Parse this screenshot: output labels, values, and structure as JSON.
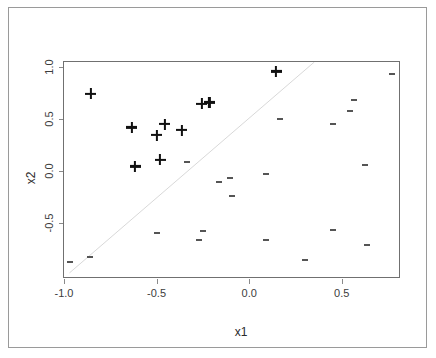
{
  "figure": {
    "title": "",
    "background": "#ffffff",
    "frame_color": "#9a9a9a",
    "panel_border_color": "#707070"
  },
  "axes": {
    "xlabel": "x1",
    "ylabel": "x2",
    "x_ticks": [
      "-1.0",
      "-0.5",
      "0.0",
      "0.5"
    ],
    "x_tick_values": [
      -1.0,
      -0.5,
      0.0,
      0.5
    ],
    "y_ticks": [
      "-0.5",
      "0.0",
      "0.5",
      "1.0"
    ],
    "y_tick_values": [
      -0.5,
      0.0,
      0.5,
      1.0
    ],
    "xlim": [
      -1.0,
      0.82
    ],
    "ylim": [
      -1.04,
      1.05
    ]
  },
  "chart_data": {
    "type": "scatter",
    "title": "",
    "xlabel": "x1",
    "ylabel": "x2",
    "xlim": [
      -1.0,
      0.82
    ],
    "ylim": [
      -1.04,
      1.05
    ],
    "grid": false,
    "legend": null,
    "legend_position": "none",
    "annotations": [
      {
        "kind": "line",
        "name": "decision-boundary",
        "description": "faint diagonal separating line",
        "x_start": -0.97,
        "y_start": -1.0,
        "x_end": 0.36,
        "y_end": 1.05,
        "color": "#d8d8d8"
      }
    ],
    "series": [
      {
        "name": "class-plus",
        "marker": "+",
        "color": "#111111",
        "points": [
          {
            "x": -0.855,
            "y": 0.745
          },
          {
            "x": -0.635,
            "y": 0.42
          },
          {
            "x": -0.5,
            "y": 0.345
          },
          {
            "x": -0.455,
            "y": 0.45
          },
          {
            "x": -0.365,
            "y": 0.395
          },
          {
            "x": -0.615,
            "y": 0.045
          },
          {
            "x": -0.48,
            "y": 0.11
          },
          {
            "x": -0.255,
            "y": 0.65
          },
          {
            "x": -0.215,
            "y": 0.66
          },
          {
            "x": 0.145,
            "y": 0.96
          }
        ]
      },
      {
        "name": "class-dash",
        "marker": "-",
        "color": "#555555",
        "points": [
          {
            "x": 0.77,
            "y": 0.935
          },
          {
            "x": 0.565,
            "y": 0.685
          },
          {
            "x": 0.545,
            "y": 0.575
          },
          {
            "x": 0.455,
            "y": 0.455
          },
          {
            "x": 0.165,
            "y": 0.505
          },
          {
            "x": -0.335,
            "y": 0.085
          },
          {
            "x": 0.09,
            "y": -0.03
          },
          {
            "x": 0.625,
            "y": 0.055
          },
          {
            "x": -0.105,
            "y": -0.07
          },
          {
            "x": -0.165,
            "y": -0.11
          },
          {
            "x": -0.095,
            "y": -0.245
          },
          {
            "x": -0.5,
            "y": -0.595
          },
          {
            "x": -0.25,
            "y": -0.58
          },
          {
            "x": -0.27,
            "y": -0.665
          },
          {
            "x": 0.09,
            "y": -0.66
          },
          {
            "x": 0.455,
            "y": -0.565
          },
          {
            "x": 0.635,
            "y": -0.715
          },
          {
            "x": 0.3,
            "y": -0.86
          },
          {
            "x": -0.86,
            "y": -0.83
          },
          {
            "x": -0.965,
            "y": -0.88
          }
        ]
      }
    ]
  }
}
